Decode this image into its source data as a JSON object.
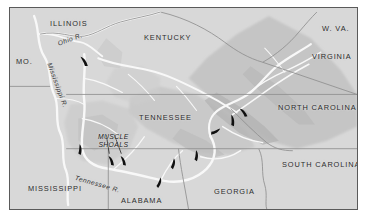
{
  "figure": {
    "kind": "thematic-reference-map",
    "frame_color": "#5a5a5a",
    "background_color": "#ffffff",
    "land_color": "#d4d4d4",
    "water_color": "#f6f6f6",
    "highland_color": "#bdbdbd",
    "dam_marker_color": "#101010",
    "border_line_color": "#8a8a8a"
  },
  "states": [
    {
      "name": "state-label-illinois",
      "label": "ILLINOIS",
      "x": 40,
      "y": 12
    },
    {
      "name": "state-label-kentucky",
      "label": "KENTUCKY",
      "x": 134,
      "y": 26
    },
    {
      "name": "state-label-west-virginia",
      "label": "W. VA.",
      "x": 312,
      "y": 17
    },
    {
      "name": "state-label-missouri",
      "label": "MO.",
      "x": 6,
      "y": 50
    },
    {
      "name": "state-label-virginia",
      "label": "VIRGINIA",
      "x": 302,
      "y": 45
    },
    {
      "name": "state-label-north-carolina",
      "label": "NORTH CAROLINA",
      "x": 268,
      "y": 96
    },
    {
      "name": "state-label-tennessee",
      "label": "TENNESSEE",
      "x": 129,
      "y": 106
    },
    {
      "name": "state-label-south-carolina",
      "label": "SOUTH CAROLINA",
      "x": 272,
      "y": 153
    },
    {
      "name": "state-label-mississippi",
      "label": "MISSISSIPPI",
      "x": 18,
      "y": 177
    },
    {
      "name": "state-label-alabama",
      "label": "ALABAMA",
      "x": 111,
      "y": 189
    },
    {
      "name": "state-label-georgia",
      "label": "GEORGIA",
      "x": 204,
      "y": 180
    }
  ],
  "rivers": [
    {
      "name": "river-label-ohio",
      "label": "Ohio R.",
      "x": 47,
      "y": 33,
      "rotate": -20
    },
    {
      "name": "river-label-mississippi",
      "label": "Mississippi R.",
      "x": 42,
      "y": 54,
      "rotate": 70
    },
    {
      "name": "river-label-tennessee",
      "label": "Tennessee R.",
      "x": 66,
      "y": 167,
      "rotate": 16
    }
  ],
  "features": [
    {
      "name": "feature-label-muscle-shoals",
      "line1": "MUSCLE",
      "line2": "SHOALS",
      "x": 88,
      "y": 125
    }
  ],
  "dams": [
    {
      "name": "dam-marker-kentucky-dam",
      "x": 74,
      "y": 53,
      "rotate": -18,
      "w": 4.2,
      "h": 11
    },
    {
      "name": "dam-marker-pickwick",
      "x": 70,
      "y": 141,
      "rotate": 16,
      "w": 4.0,
      "h": 10
    },
    {
      "name": "dam-marker-wilson",
      "x": 101,
      "y": 152,
      "rotate": -8,
      "w": 4.0,
      "h": 10
    },
    {
      "name": "dam-marker-wheeler",
      "x": 113,
      "y": 152,
      "rotate": -8,
      "w": 4.0,
      "h": 10
    },
    {
      "name": "dam-marker-guntersville",
      "x": 149,
      "y": 174,
      "rotate": 35,
      "w": 4.0,
      "h": 10
    },
    {
      "name": "dam-marker-chickamauga",
      "x": 163,
      "y": 155,
      "rotate": 28,
      "w": 4.2,
      "h": 10
    },
    {
      "name": "dam-marker-watts-bar",
      "x": 186,
      "y": 147,
      "rotate": 18,
      "w": 4.2,
      "h": 10
    },
    {
      "name": "dam-marker-fort-loudoun",
      "x": 205,
      "y": 123,
      "rotate": 78,
      "w": 4.2,
      "h": 10
    },
    {
      "name": "dam-marker-norris",
      "x": 222,
      "y": 112,
      "rotate": 8,
      "w": 4.2,
      "h": 11
    },
    {
      "name": "dam-marker-cherokee",
      "x": 233,
      "y": 104,
      "rotate": -24,
      "w": 4.0,
      "h": 10
    }
  ]
}
